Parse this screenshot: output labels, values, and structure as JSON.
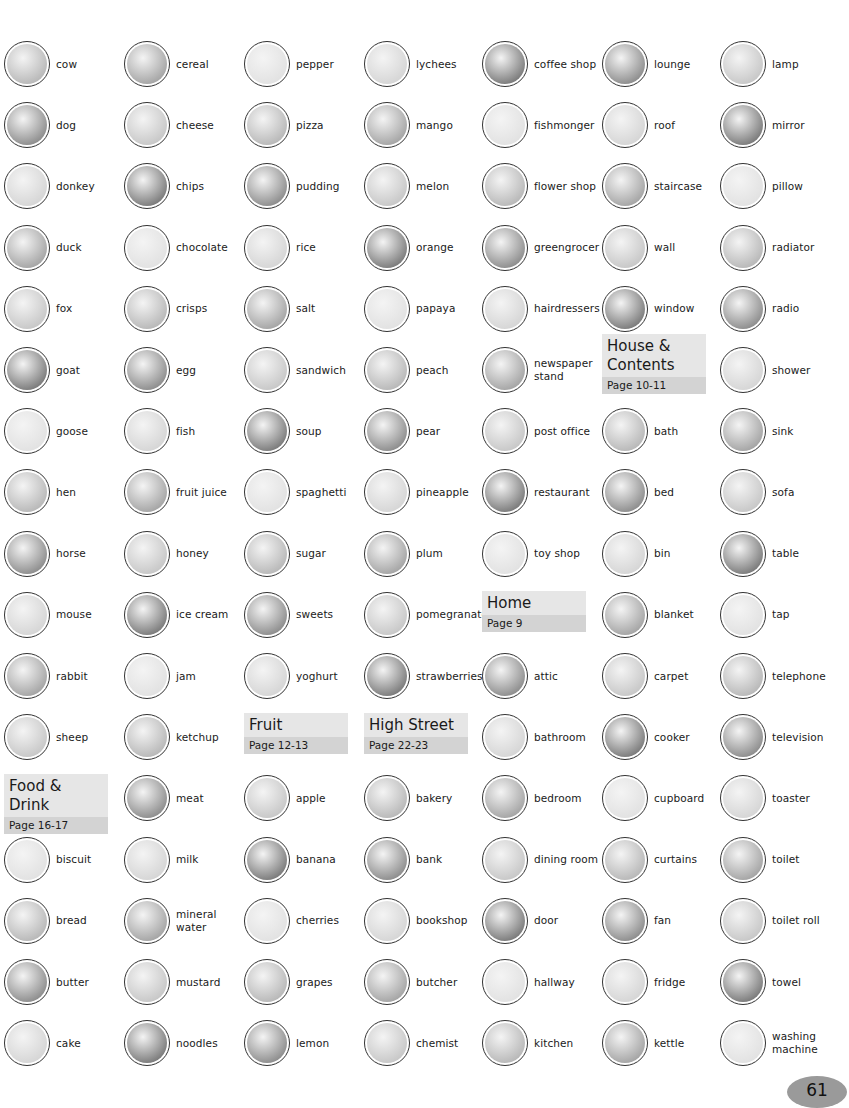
{
  "columns": [
    {
      "items": [
        "cow",
        "dog",
        "donkey",
        "duck",
        "fox",
        "goat",
        "goose",
        "hen",
        "horse",
        "mouse",
        "rabbit",
        "sheep",
        null,
        "biscuit",
        "bread",
        "butter",
        "cake"
      ],
      "header": {
        "row": 12,
        "title": "Food & Drink",
        "page": "Page 16-17"
      }
    },
    {
      "items": [
        "cereal",
        "cheese",
        "chips",
        "chocolate",
        "crisps",
        "egg",
        "fish",
        "fruit juice",
        "honey",
        "ice cream",
        "jam",
        "ketchup",
        "meat",
        "milk",
        "mineral water",
        "mustard",
        "noodles"
      ]
    },
    {
      "items": [
        "pepper",
        "pizza",
        "pudding",
        "rice",
        "salt",
        "sandwich",
        "soup",
        "spaghetti",
        "sugar",
        "sweets",
        "yoghurt",
        null,
        "apple",
        "banana",
        "cherries",
        "grapes",
        "lemon"
      ],
      "header": {
        "row": 11,
        "title": "Fruit",
        "page": "Page 12-13"
      }
    },
    {
      "items": [
        "lychees",
        "mango",
        "melon",
        "orange",
        "papaya",
        "peach",
        "pear",
        "pineapple",
        "plum",
        "pomegranate",
        "strawberries",
        null,
        "bakery",
        "bank",
        "bookshop",
        "butcher",
        "chemist"
      ],
      "header": {
        "row": 11,
        "title": "High Street",
        "page": "Page 22-23"
      }
    },
    {
      "items": [
        "coffee shop",
        "fishmonger",
        "flower shop",
        "greengrocer",
        "hairdressers",
        "newspaper stand",
        "post office",
        "restaurant",
        "toy shop",
        null,
        "attic",
        "bathroom",
        "bedroom",
        "dining room",
        "door",
        "hallway",
        "kitchen"
      ],
      "header": {
        "row": 9,
        "title": "Home",
        "page": "Page 9"
      }
    },
    {
      "items": [
        "lounge",
        "roof",
        "staircase",
        "wall",
        "window",
        null,
        "bath",
        "bed",
        "bin",
        "blanket",
        "carpet",
        "cooker",
        "cupboard",
        "curtains",
        "fan",
        "fridge",
        "kettle"
      ],
      "header": {
        "row": 5,
        "title": "House & Contents",
        "page": "Page 10-11"
      }
    },
    {
      "items": [
        "lamp",
        "mirror",
        "pillow",
        "radiator",
        "radio",
        "shower",
        "sink",
        "sofa",
        "table",
        "tap",
        "telephone",
        "television",
        "toaster",
        "toilet",
        "toilet roll",
        "towel",
        "washing machine"
      ]
    }
  ],
  "page_number": "61",
  "colors": {
    "header_bg": "#e6e6e6",
    "header_page_bg": "#d3d3d3",
    "page_badge": "#9a9a9a"
  }
}
